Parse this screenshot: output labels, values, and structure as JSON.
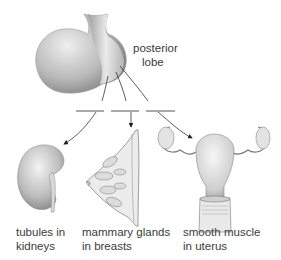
{
  "diagram": {
    "source_label": {
      "line1": "posterior",
      "line2": "lobe"
    },
    "targets": [
      {
        "id": "kidneys",
        "line1": "tubules in",
        "line2": "kidneys"
      },
      {
        "id": "breasts",
        "line1": "mammary glands",
        "line2": "in breasts"
      },
      {
        "id": "uterus",
        "line1": "smooth muscle",
        "line2": "in uterus"
      }
    ]
  },
  "colors": {
    "line": "#333333",
    "text": "#3a3a3a",
    "tissue_light": "#f2f2f2",
    "tissue_dark": "#8a8a8a"
  }
}
